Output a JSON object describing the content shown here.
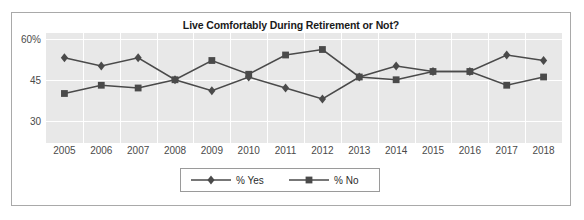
{
  "chart_data": {
    "type": "line",
    "title": "Live Comfortably During Retirement or Not?",
    "xlabel": "",
    "ylabel": "",
    "categories": [
      "2005",
      "2006",
      "2007",
      "2008",
      "2009",
      "2010",
      "2011",
      "2012",
      "2013",
      "2014",
      "2015",
      "2016",
      "2017",
      "2018"
    ],
    "ytick_labels": [
      "60%",
      "45",
      "30"
    ],
    "ytick_values": [
      60,
      45,
      30
    ],
    "ylim": [
      22,
      62
    ],
    "grid": true,
    "legend_position": "bottom",
    "series": [
      {
        "name": "% Yes",
        "marker": "diamond",
        "color": "#4a4a4a",
        "values": [
          53,
          50,
          53,
          45,
          41,
          46,
          42,
          38,
          46,
          50,
          48,
          48,
          54,
          52
        ]
      },
      {
        "name": "% No",
        "marker": "square",
        "color": "#4a4a4a",
        "values": [
          40,
          43,
          42,
          45,
          52,
          47,
          54,
          56,
          46,
          45,
          48,
          48,
          43,
          46
        ]
      }
    ]
  },
  "legend": {
    "items": [
      {
        "label": "% Yes",
        "marker": "diamond"
      },
      {
        "label": "% No",
        "marker": "square"
      }
    ]
  },
  "colors": {
    "plot_background": "#e8e8e8",
    "gridline": "#ffffff",
    "series_line": "#4a4a4a",
    "frame_border": "#a9a9a9",
    "axis_text": "#4a4a4a",
    "title_text": "#1a1a1a"
  }
}
